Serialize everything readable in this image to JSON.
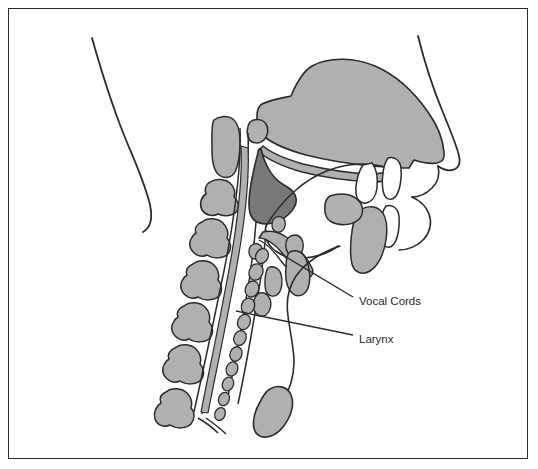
{
  "figure": {
    "background_color": "#ffffff",
    "border_color": "#2b2b2b",
    "line_color": "#2b2b2b",
    "fill_light_gray": "#b0b0b0",
    "fill_dark_gray": "#787878",
    "fill_white": "#ffffff"
  },
  "labels": [
    {
      "id": "vocal-cords",
      "text": "Vocal Cords",
      "x": 359,
      "y": 302,
      "leader_from_x": 353,
      "leader_from_y": 297,
      "leader_to_x": 276,
      "leader_to_y": 251
    },
    {
      "id": "larynx",
      "text": "Larynx",
      "x": 359,
      "y": 340,
      "leader_from_x": 353,
      "leader_from_y": 335,
      "leader_to_x": 236,
      "leader_to_y": 311
    }
  ],
  "structures": [
    {
      "id": "neck-profile",
      "name": "back-of-neck-profile",
      "fill": "none"
    },
    {
      "id": "nasal-palate-mass",
      "name": "nasal-cavity-and-hard-palate",
      "fill": "#b0b0b0"
    },
    {
      "id": "nose-profile",
      "name": "nose-and-upper-lip-profile",
      "fill": "none"
    },
    {
      "id": "soft-palate",
      "name": "soft-palate-and-uvula",
      "fill": "#787878"
    },
    {
      "id": "hard-palate-strip",
      "name": "palate-lining-strip",
      "fill": "#b0b0b0"
    },
    {
      "id": "tongue",
      "name": "tongue-outline",
      "fill": "#ffffff"
    },
    {
      "id": "vertebrae",
      "name": "cervical-vertebrae-column",
      "fill": "#b0b0b0",
      "count": 7
    },
    {
      "id": "epiglottis",
      "name": "epiglottis",
      "fill": "#b0b0b0"
    },
    {
      "id": "laryngeal-cartilages",
      "name": "laryngeal-cartilages",
      "fill": "#b0b0b0"
    },
    {
      "id": "tracheal-rings",
      "name": "tracheal-cartilage-rings",
      "fill": "#b0b0b0",
      "count": 11
    },
    {
      "id": "teeth",
      "name": "teeth",
      "fill": "#ffffff"
    },
    {
      "id": "mandible",
      "name": "mandible",
      "fill": "#b0b0b0"
    },
    {
      "id": "sternum",
      "name": "sternum-manubrium",
      "fill": "#b0b0b0"
    },
    {
      "id": "esophagus",
      "name": "esophagus-trachea-lines",
      "fill": "none"
    }
  ]
}
